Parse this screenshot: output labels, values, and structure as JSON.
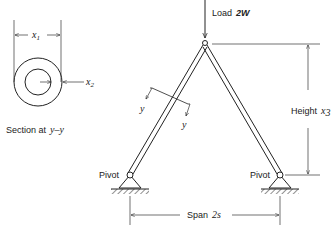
{
  "diagram": {
    "type": "two-bar truss",
    "section": {
      "caption_prefix": "Section at",
      "caption_var": "y–y",
      "outer_dim_label": "x",
      "outer_dim_sub": "1",
      "inner_dim_label": "x",
      "inner_dim_sub": "2"
    },
    "load": {
      "label_prefix": "Load",
      "label_value": "2W"
    },
    "height": {
      "label_prefix": "Height",
      "label_var": "x",
      "label_sub": "3"
    },
    "span": {
      "label_prefix": "Span",
      "label_value": "2s"
    },
    "pivots": [
      {
        "label": "Pivot"
      },
      {
        "label": "Pivot"
      }
    ],
    "section_cut": {
      "label_a": "y",
      "label_b": "y"
    }
  }
}
